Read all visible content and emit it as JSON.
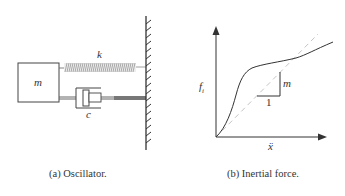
{
  "panel_a": {
    "caption": "(a) Oscillator.",
    "mass_label": "m",
    "spring_label": "k",
    "damper_label": "c"
  },
  "panel_b": {
    "caption": "(b) Inertial force.",
    "y_axis_label": "f",
    "y_axis_subscript": "i",
    "x_axis_label": "ẍ",
    "slope_rise_label": "m",
    "slope_run_label": "1"
  },
  "colors": {
    "line": "#333333",
    "dashed_reference": "#bdbdbd",
    "spring_fill": "#999999"
  }
}
